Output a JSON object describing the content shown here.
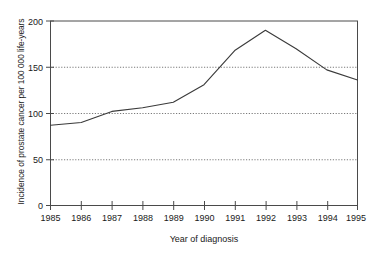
{
  "chart_data": {
    "type": "line",
    "title": "",
    "xlabel": "Year of diagnosis",
    "ylabel": "Incidence of prostate cancer per 100 000 life-years",
    "x": [
      1985,
      1986,
      1987,
      1988,
      1989,
      1990,
      1991,
      1992,
      1993,
      1994,
      1995
    ],
    "categories": [
      "1985",
      "1986",
      "1987",
      "1988",
      "1989",
      "1990",
      "1991",
      "1992",
      "1993",
      "1994",
      "1995"
    ],
    "values": [
      87,
      90,
      102,
      106,
      112,
      131,
      168,
      190,
      170,
      147,
      136
    ],
    "series": [
      {
        "name": "Incidence of prostate cancer",
        "values": [
          87,
          90,
          102,
          106,
          112,
          131,
          168,
          190,
          170,
          147,
          136
        ]
      }
    ],
    "xlim": [
      1985,
      1995
    ],
    "ylim": [
      0,
      200
    ],
    "ytick_labels": [
      "0",
      "50",
      "100",
      "150",
      "200"
    ],
    "yticks": [
      0,
      50,
      100,
      150,
      200
    ],
    "xtick_labels": [
      "1985",
      "1986",
      "1987",
      "1988",
      "1989",
      "1990",
      "1991",
      "1992",
      "1993",
      "1994",
      "1995"
    ],
    "grid": "horizontal-dotted",
    "gridlines_at": [
      50,
      100,
      150
    ],
    "legend": "none",
    "line_color": "#3a3a3a",
    "axis_color": "#4a4a4a",
    "grid_color": "#7a7a7a",
    "background_color": "#ffffff"
  }
}
